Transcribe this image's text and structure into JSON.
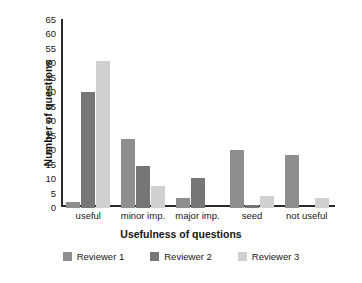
{
  "chart_data": {
    "type": "bar",
    "title": "",
    "xlabel": "Usefulness of questions",
    "ylabel": "Number of questions",
    "categories": [
      "useful",
      "minor imp.",
      "major imp.",
      "seed",
      "not useful"
    ],
    "series": [
      {
        "name": "Reviewer 1",
        "color": "#8e8e8e",
        "values": [
          2,
          24,
          3.5,
          20,
          18.5
        ]
      },
      {
        "name": "Reviewer 2",
        "color": "#767676",
        "values": [
          40,
          14.5,
          10.5,
          1,
          0
        ]
      },
      {
        "name": "Reviewer 3",
        "color": "#d0d0d0",
        "values": [
          51,
          7.5,
          0,
          4,
          3.5
        ]
      }
    ],
    "ylim": [
      0,
      65
    ],
    "ytick_step": 5,
    "yticks": [
      65,
      60,
      55,
      50,
      45,
      40,
      35,
      30,
      25,
      20,
      15,
      10,
      5,
      0
    ],
    "grid": false,
    "legend_position": "bottom"
  }
}
